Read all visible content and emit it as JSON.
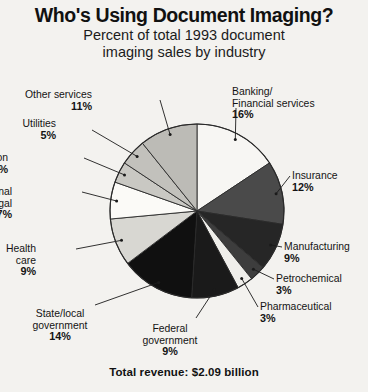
{
  "header": {
    "title": "Who's Using Document Imaging?",
    "subtitle_line1": "Percent of total 1993 document",
    "subtitle_line2": "imaging sales by industry"
  },
  "footer": {
    "total_revenue": "Total revenue: $2.09 billion"
  },
  "chart_data": {
    "type": "pie",
    "title": "Who's Using Document Imaging?",
    "subtitle": "Percent of total 1993 document imaging sales by industry",
    "annotation": "Total revenue: $2.09 billion",
    "unit": "percent",
    "legend": "none",
    "labels_position": "outside-with-leader-lines",
    "start_angle_deg": 0,
    "direction": "clockwise",
    "categories": [
      "Banking/Financial services",
      "Insurance",
      "Manufacturing",
      "Petrochemical",
      "Pharmaceutical",
      "Federal government",
      "State/local government",
      "Health care",
      "Professional services/legal",
      "Transportation",
      "Utilities",
      "Other services"
    ],
    "values": [
      16,
      12,
      9,
      3,
      3,
      9,
      14,
      9,
      7,
      4,
      5,
      11
    ],
    "total": 102,
    "slices": [
      {
        "label_line1": "Banking/",
        "label_line2": "Financial services",
        "label": "Banking/Financial services",
        "value": 16,
        "pct": "16%",
        "fill": "#f7f6f3"
      },
      {
        "label_line1": "Insurance",
        "label_line2": "",
        "label": "Insurance",
        "value": 12,
        "pct": "12%",
        "fill": "#4a4a4a"
      },
      {
        "label_line1": "Manufacturing",
        "label_line2": "",
        "label": "Manufacturing",
        "value": 9,
        "pct": "9%",
        "fill": "#262626"
      },
      {
        "label_line1": "Petrochemical",
        "label_line2": "",
        "label": "Petrochemical",
        "value": 3,
        "pct": "3%",
        "fill": "#3d3d3d"
      },
      {
        "label_line1": "Pharmaceutical",
        "label_line2": "",
        "label": "Pharmaceutical",
        "value": 3,
        "pct": "3%",
        "fill": "#efeeea"
      },
      {
        "label_line1": "Federal",
        "label_line2": "government",
        "label": "Federal government",
        "value": 9,
        "pct": "9%",
        "fill": "#1a1a1a"
      },
      {
        "label_line1": "State/local",
        "label_line2": "government",
        "label": "State/local government",
        "value": 14,
        "pct": "14%",
        "fill": "#101010"
      },
      {
        "label_line1": "Health",
        "label_line2": "care",
        "label": "Health care",
        "value": 9,
        "pct": "9%",
        "fill": "#d8d7d2"
      },
      {
        "label_line1": "Professional",
        "label_line2": "services/legal",
        "label": "Professional services/legal",
        "value": 7,
        "pct": "7%",
        "fill": "#fbfaf7"
      },
      {
        "label_line1": "Transportation",
        "label_line2": "",
        "label": "Transportation",
        "value": 4,
        "pct": "4%",
        "fill": "#c9c8c3"
      },
      {
        "label_line1": "Utilities",
        "label_line2": "",
        "label": "Utilities",
        "value": 5,
        "pct": "5%",
        "fill": "#c2c1bc"
      },
      {
        "label_line1": "Other services",
        "label_line2": "",
        "label": "Other services",
        "value": 11,
        "pct": "11%",
        "fill": "#bcbbb6"
      }
    ],
    "geometry": {
      "cx": 197,
      "cy": 211,
      "r": 87
    }
  }
}
